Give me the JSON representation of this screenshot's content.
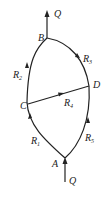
{
  "diagram": {
    "type": "flow network / bridge circuit",
    "nodes": [
      {
        "id": "A",
        "label": "A"
      },
      {
        "id": "B",
        "label": "B"
      },
      {
        "id": "C",
        "label": "C"
      },
      {
        "id": "D",
        "label": "D"
      }
    ],
    "edges": [
      {
        "from": "A",
        "to": "C",
        "label": "R",
        "sub": "1"
      },
      {
        "from": "C",
        "to": "B",
        "label": "R",
        "sub": "2"
      },
      {
        "from": "B",
        "to": "D",
        "label": "R",
        "sub": "3"
      },
      {
        "from": "C",
        "to": "D",
        "label": "R",
        "sub": "4"
      },
      {
        "from": "A",
        "to": "D",
        "label": "R",
        "sub": "5"
      }
    ],
    "inflow": {
      "label": "Q",
      "node": "A"
    },
    "outflow": {
      "label": "Q",
      "node": "B"
    }
  }
}
